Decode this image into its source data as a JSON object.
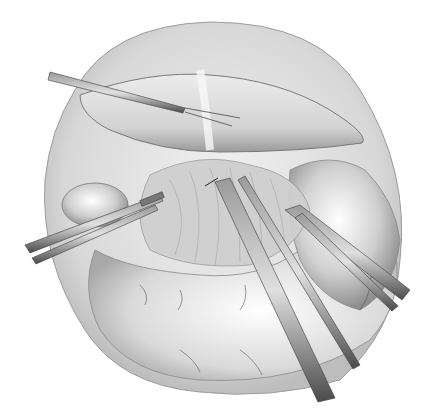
{
  "image": {
    "subject": "Laparoscopic surgical illustration: liver retracted, dissection near gallbladder with grasping instruments",
    "style": "grayscale pencil illustration",
    "colors": {
      "background": "#ffffff",
      "tissue_light": "#e6e6e6",
      "tissue_mid": "#c8c8c8",
      "tissue_dark": "#8a8a8a",
      "instrument": "#6e6e6e",
      "instrument_dark": "#3a3a3a"
    },
    "elements": [
      "liver-lobe",
      "abdominal-wall-circle",
      "gallbladder",
      "hepatoduodenal-ligament",
      "stomach",
      "retractor-instrument",
      "left-grasper",
      "center-dissector",
      "right-grasper"
    ]
  }
}
